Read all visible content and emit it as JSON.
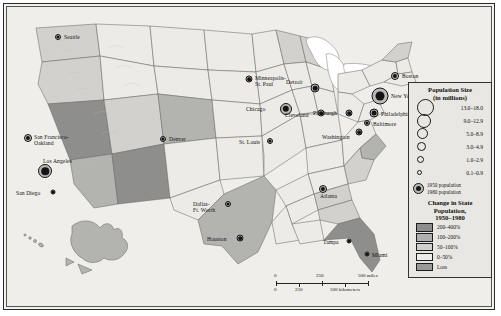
{
  "map": {
    "title": "United States Population and Population Change Map, 1950-1980",
    "background_color": "#efeeea"
  },
  "cities": [
    {
      "name": "Seattle",
      "x": 50,
      "y": 29,
      "outer": 6,
      "inner": 3.0,
      "label_dx": 6,
      "label_dy": -3,
      "align": "left"
    },
    {
      "name": "San Francisco-\nOakland",
      "x": 20,
      "y": 130,
      "outer": 8,
      "inner": 4.2,
      "label_dx": 6,
      "label_dy": -4,
      "align": "left"
    },
    {
      "name": "Los Angeles",
      "x": 37,
      "y": 163,
      "outer": 14,
      "inner": 7.5,
      "label_dx": -2,
      "label_dy": -13,
      "align": "left"
    },
    {
      "name": "San Diego",
      "x": 45,
      "y": 184,
      "outer": 5,
      "inner": 2.6,
      "label_dx": -37,
      "label_dy": -2,
      "align": "left"
    },
    {
      "name": "Denver",
      "x": 155,
      "y": 131,
      "outer": 6,
      "inner": 3.2,
      "label_dx": 6,
      "label_dy": -3,
      "align": "left"
    },
    {
      "name": "Minneapolis-\nSt. Paul",
      "x": 241,
      "y": 71,
      "outer": 7,
      "inner": 3.6,
      "label_dx": 6,
      "label_dy": -4,
      "align": "left"
    },
    {
      "name": "Chicago",
      "x": 278,
      "y": 101,
      "outer": 12,
      "inner": 6.4,
      "label_dx": -40,
      "label_dy": -3,
      "align": "left"
    },
    {
      "name": "Detroit",
      "x": 307,
      "y": 80,
      "outer": 9,
      "inner": 4.6,
      "label_dx": -29,
      "label_dy": -9,
      "align": "left"
    },
    {
      "name": "Cleveland",
      "x": 313,
      "y": 105,
      "outer": 7,
      "inner": 3.6,
      "label_dx": -36,
      "label_dy": -1,
      "align": "left"
    },
    {
      "name": "St. Louis",
      "x": 262,
      "y": 133,
      "outer": 6,
      "inner": 3.2,
      "label_dx": -31,
      "label_dy": -2,
      "align": "left"
    },
    {
      "name": "Pittsburgh",
      "x": 341,
      "y": 105,
      "outer": 7,
      "inner": 3.6,
      "label_dx": -36,
      "label_dy": -3,
      "align": "left"
    },
    {
      "name": "New York",
      "x": 372,
      "y": 88,
      "outer": 17,
      "inner": 9.0,
      "label_dx": 11,
      "label_dy": -3,
      "align": "left"
    },
    {
      "name": "Boston",
      "x": 387,
      "y": 68,
      "outer": 8,
      "inner": 4.2,
      "label_dx": 7,
      "label_dy": -3,
      "align": "left"
    },
    {
      "name": "Philadelphia",
      "x": 366,
      "y": 105,
      "outer": 9,
      "inner": 4.8,
      "label_dx": 7,
      "label_dy": -2,
      "align": "left"
    },
    {
      "name": "Baltimore",
      "x": 359,
      "y": 115,
      "outer": 6,
      "inner": 3.0,
      "label_dx": 6,
      "label_dy": -2,
      "align": "left"
    },
    {
      "name": "Washington",
      "x": 351,
      "y": 124,
      "outer": 7,
      "inner": 3.6,
      "label_dx": -37,
      "label_dy": 2,
      "align": "left"
    },
    {
      "name": "Dallas-\nFt. Worth",
      "x": 220,
      "y": 196,
      "outer": 6,
      "inner": 3.0,
      "label_dx": -35,
      "label_dy": -3,
      "align": "left"
    },
    {
      "name": "Houston",
      "x": 232,
      "y": 230,
      "outer": 7,
      "inner": 3.6,
      "label_dx": -33,
      "label_dy": -2,
      "align": "left"
    },
    {
      "name": "Atlanta",
      "x": 315,
      "y": 181,
      "outer": 8,
      "inner": 4.2,
      "label_dx": -3,
      "label_dy": 4,
      "align": "left"
    },
    {
      "name": "Tampa",
      "x": 341,
      "y": 233,
      "outer": 5,
      "inner": 2.6,
      "label_dx": -26,
      "label_dy": -2,
      "align": "left"
    },
    {
      "name": "Miami",
      "x": 359,
      "y": 246,
      "outer": 5,
      "inner": 2.6,
      "label_dx": 5,
      "label_dy": -2,
      "align": "left"
    }
  ],
  "legend": {
    "size_title_line1": "Population Size",
    "size_title_line2": "(in millions)",
    "size_classes": [
      {
        "label": "13.0–18.0",
        "diameter": 15
      },
      {
        "label": "9.0–12.9",
        "diameter": 12
      },
      {
        "label": "5.0–8.9",
        "diameter": 9
      },
      {
        "label": "3.0–4.9",
        "diameter": 7
      },
      {
        "label": "1.0–2.9",
        "diameter": 5
      },
      {
        "label": "0.1–0.9",
        "diameter": 3
      }
    ],
    "note_1950": "1950 population",
    "note_1980": "1980 population",
    "change_title_line1": "Change in State",
    "change_title_line2": "Population,",
    "change_title_line3": "1950–1980",
    "change_classes": [
      {
        "label": "200–400%",
        "color": "#8d8d8d"
      },
      {
        "label": "100–200%",
        "color": "#b0b0b0"
      },
      {
        "label": "50–100%",
        "color": "#cfcfcf"
      },
      {
        "label": "0–50%",
        "color": "#ededea"
      },
      {
        "label": "Loss",
        "color": "#9a9a9a"
      }
    ]
  },
  "scale_bar": {
    "miles": {
      "start": "0",
      "mid": "250",
      "end": "500 miles"
    },
    "kilometers": {
      "start": "0",
      "mid": "250",
      "end": "500 kilometers"
    }
  }
}
